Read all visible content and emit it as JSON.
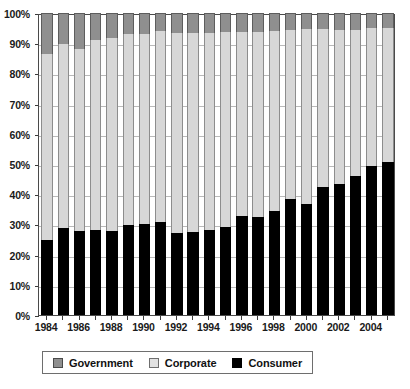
{
  "chart_data": {
    "type": "bar",
    "subtype": "stacked-100-percent",
    "title": "",
    "xlabel": "",
    "ylabel": "",
    "ylim": [
      0,
      100
    ],
    "ytick_labels": [
      "0%",
      "10%",
      "20%",
      "30%",
      "40%",
      "50%",
      "60%",
      "70%",
      "80%",
      "90%",
      "100%"
    ],
    "ytick_values": [
      0,
      10,
      20,
      30,
      40,
      50,
      60,
      70,
      80,
      90,
      100
    ],
    "grid": true,
    "legend_position": "bottom",
    "categories": [
      "1984",
      "1985",
      "1986",
      "1987",
      "1988",
      "1989",
      "1990",
      "1991",
      "1992",
      "1993",
      "1994",
      "1995",
      "1996",
      "1997",
      "1998",
      "1999",
      "2000",
      "2001",
      "2002",
      "2003",
      "2004",
      "2005"
    ],
    "xtick_labels_shown": [
      "1984",
      "1986",
      "1988",
      "1990",
      "1992",
      "1994",
      "1996",
      "1998",
      "2000",
      "2002",
      "2004"
    ],
    "series": [
      {
        "name": "Consumer",
        "color": "#000000",
        "values": [
          24.9,
          28.8,
          27.8,
          28.3,
          27.8,
          29.7,
          30.3,
          30.8,
          27.3,
          27.6,
          28.3,
          29.3,
          32.7,
          32.6,
          34.5,
          38.5,
          36.9,
          42.5,
          43.3,
          46.1,
          49.5,
          50.6
        ]
      },
      {
        "name": "Corporate",
        "color": "#d7d7d7",
        "values": [
          61.6,
          60.8,
          60.3,
          62.8,
          64.0,
          63.3,
          62.8,
          63.3,
          66.1,
          65.8,
          65.2,
          64.3,
          61.1,
          61.1,
          59.5,
          56.0,
          57.8,
          52.2,
          51.2,
          48.3,
          45.5,
          44.4
        ]
      },
      {
        "name": "Government",
        "color": "#8f8f8f",
        "values": [
          13.5,
          10.4,
          11.9,
          8.9,
          8.2,
          7.0,
          6.9,
          5.9,
          6.6,
          6.6,
          6.5,
          6.4,
          6.2,
          6.3,
          6.0,
          5.5,
          5.3,
          5.3,
          5.5,
          5.6,
          5.0,
          5.0
        ]
      }
    ],
    "legend": [
      {
        "label": "Government",
        "color": "#8f8f8f"
      },
      {
        "label": "Corporate",
        "color": "#d7d7d7"
      },
      {
        "label": "Consumer",
        "color": "#000000"
      }
    ]
  }
}
